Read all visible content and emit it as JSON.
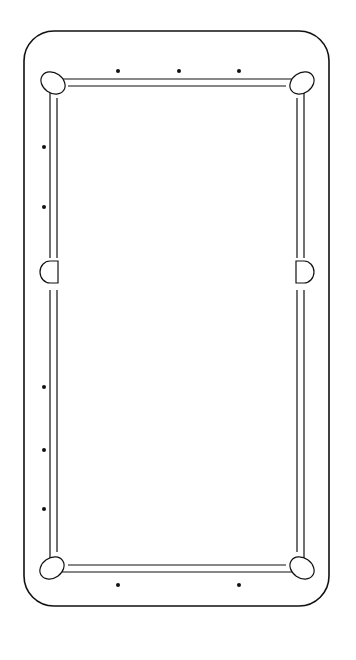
{
  "page": {
    "number": "198",
    "running_head": "Pocket Billiards With Cue Tip",
    "caption": "Diagram 68. Nine Ball Game."
  },
  "table": {
    "pocket_labels": {
      "left_foot": "LEFT-FOOT-POCKET",
      "right_foot": "RIGHT-FOOT-POCKET",
      "left_head": "LEFT-HEAD-POCKET",
      "right_head": "RIGHT-HEAD-POCKET"
    },
    "rails": {
      "rail_1": {
        "label": "RAIL",
        "numeral": "I"
      },
      "rail_2": {
        "label": "RAIL",
        "numeral": "II"
      },
      "rail_3": {
        "label": "RAIL",
        "numeral": "III"
      },
      "rail_4": {
        "label": "RAIL",
        "numeral": "IV"
      }
    },
    "side_labels": {
      "left": "LEFT",
      "right": "RIGHT"
    },
    "diamond_numbers": {
      "top": [
        "9",
        "8",
        "7"
      ],
      "right": [
        "6",
        "5",
        "4",
        "3",
        "2",
        "1"
      ],
      "left": [
        "10",
        "11",
        "12",
        "13",
        "14",
        "15"
      ],
      "bottom": [
        "16",
        "17",
        "18"
      ]
    }
  },
  "balls": [
    {
      "number": "1"
    },
    {
      "number": "2"
    },
    {
      "number": "3"
    },
    {
      "number": "4"
    },
    {
      "number": "5"
    },
    {
      "number": "6"
    },
    {
      "number": "7"
    },
    {
      "number": "8"
    },
    {
      "number": "9"
    }
  ]
}
